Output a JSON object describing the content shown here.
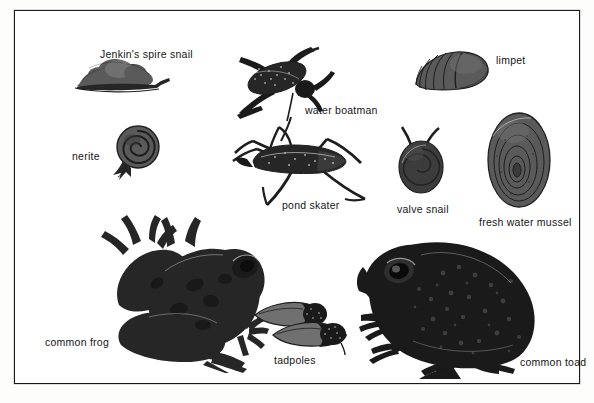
{
  "plate": {
    "title": "Pond and freshwater creatures identification plate",
    "background_color": "#fdfdfb",
    "frame_color": "#1b1b1b",
    "label_color": "#151515"
  },
  "specimens": [
    {
      "id": "jenkins-spire-snail",
      "label": "Jenkin's spire snail",
      "label_x": 85,
      "label_y": 37
    },
    {
      "id": "water-boatman",
      "label": "water boatman",
      "label_x": 290,
      "label_y": 93
    },
    {
      "id": "limpet",
      "label": "limpet",
      "label_x": 481,
      "label_y": 43
    },
    {
      "id": "nerite",
      "label": "nerite",
      "label_x": 57,
      "label_y": 139
    },
    {
      "id": "pond-skater",
      "label": "pond skater",
      "label_x": 267,
      "label_y": 188
    },
    {
      "id": "valve-snail",
      "label": "valve snail",
      "label_x": 382,
      "label_y": 192
    },
    {
      "id": "fresh-water-mussel",
      "label": "fresh water mussel",
      "label_x": 464,
      "label_y": 205
    },
    {
      "id": "common-frog",
      "label": "common frog",
      "label_x": 30,
      "label_y": 325
    },
    {
      "id": "tadpoles",
      "label": "tadpoles",
      "label_x": 259,
      "label_y": 343
    },
    {
      "id": "common-toad",
      "label": "common toad",
      "label_x": 505,
      "label_y": 345
    }
  ]
}
